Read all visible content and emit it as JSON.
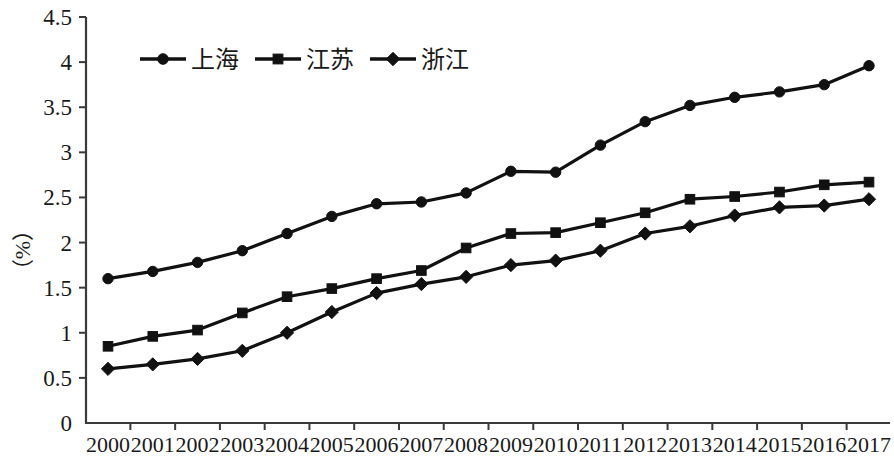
{
  "chart_data": {
    "type": "line",
    "title": "",
    "subtitle": "",
    "xlabel": "",
    "ylabel": "（%）",
    "ylim": [
      0,
      4.5
    ],
    "ytick_step": 0.5,
    "grid": false,
    "legend_position": "top-left-inside",
    "categories": [
      "2000",
      "2001",
      "2002",
      "2003",
      "2004",
      "2005",
      "2006",
      "2007",
      "2008",
      "2009",
      "2010",
      "2011",
      "2012",
      "2013",
      "2014",
      "2015",
      "2016",
      "2017"
    ],
    "ytick_labels": [
      "0",
      "0.5",
      "1",
      "1.5",
      "2",
      "2.5",
      "3",
      "3.5",
      "4",
      "4.5"
    ],
    "ytick_values": [
      0,
      0.5,
      1,
      1.5,
      2,
      2.5,
      3,
      3.5,
      4,
      4.5
    ],
    "series": [
      {
        "name": "上海",
        "marker": "circle",
        "color": "#111111",
        "values": [
          1.6,
          1.68,
          1.78,
          1.91,
          2.1,
          2.29,
          2.43,
          2.45,
          2.55,
          2.79,
          2.78,
          3.08,
          3.34,
          3.52,
          3.61,
          3.67,
          3.75,
          3.96
        ]
      },
      {
        "name": "江苏",
        "marker": "square",
        "color": "#111111",
        "values": [
          0.85,
          0.96,
          1.03,
          1.22,
          1.4,
          1.49,
          1.6,
          1.69,
          1.94,
          2.1,
          2.11,
          2.22,
          2.33,
          2.48,
          2.51,
          2.56,
          2.64,
          2.67
        ]
      },
      {
        "name": "浙江",
        "marker": "diamond",
        "color": "#111111",
        "values": [
          0.6,
          0.65,
          0.71,
          0.8,
          1.0,
          1.23,
          1.44,
          1.54,
          1.62,
          1.75,
          1.8,
          1.91,
          2.1,
          2.18,
          2.3,
          2.39,
          2.41,
          2.48
        ]
      }
    ]
  },
  "legend": {
    "items": [
      {
        "label": "上海",
        "marker": "circle"
      },
      {
        "label": "江苏",
        "marker": "square"
      },
      {
        "label": "浙江",
        "marker": "diamond"
      }
    ]
  },
  "axis": {
    "y_title": "（%）"
  }
}
